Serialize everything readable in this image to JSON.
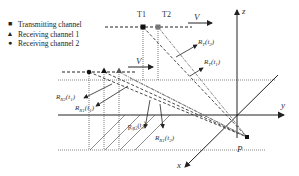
{
  "legend": {
    "items": [
      {
        "marker": "■",
        "label": "Transmitting channel"
      },
      {
        "marker": "▲",
        "label": "Receiving channel 1"
      },
      {
        "marker": "●",
        "label": "Receiving channel 2"
      }
    ]
  },
  "positions": {
    "t1": "T1",
    "t2": "T2"
  },
  "velocity": {
    "top": "V",
    "middle": "V"
  },
  "axes": {
    "z": "z",
    "y": "y",
    "x": "x"
  },
  "target": {
    "label": "P"
  },
  "ranges": {
    "rt_t2": {
      "base": "R",
      "sub": "T",
      "arg": "(t",
      "argsub": "2",
      "close": ")"
    },
    "rt_t1": {
      "base": "R",
      "sub": "T",
      "arg": "(t",
      "argsub": "1",
      "close": ")"
    },
    "rr2_t1": {
      "base": "R",
      "sub": "R2",
      "arg": "(t",
      "argsub": "1",
      "close": ")"
    },
    "rr1_t1": {
      "base": "R",
      "sub": "R1",
      "arg": "(t",
      "argsub": "1",
      "close": ")"
    },
    "rr2_t2": {
      "base": "R",
      "sub": "R2",
      "arg": "(t",
      "argsub": "2",
      "close": ")"
    },
    "rr1_t2": {
      "base": "R",
      "sub": "R1",
      "arg": "(t",
      "argsub": "2",
      "close": ")"
    }
  },
  "colors": {
    "line": "#222222",
    "dashed_light": "#666666",
    "text": "#333333"
  }
}
